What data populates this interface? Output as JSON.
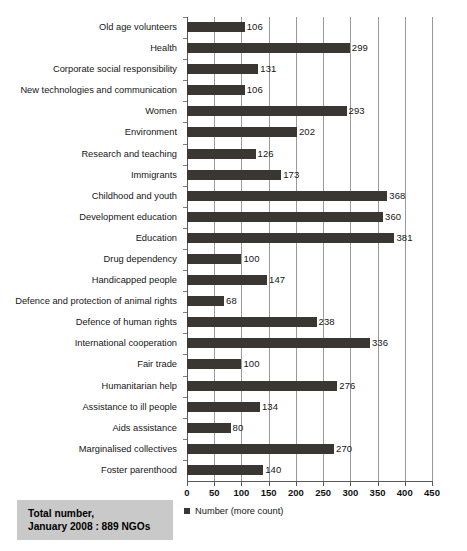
{
  "chart_data": {
    "type": "bar",
    "orientation": "horizontal",
    "title": "",
    "xlabel": "",
    "ylabel": "",
    "xlim": [
      0,
      450
    ],
    "xticks": [
      0,
      50,
      100,
      150,
      200,
      250,
      300,
      350,
      400,
      450
    ],
    "grid": true,
    "grid_axis": "x",
    "legend": {
      "position": "bottom-left",
      "entries": [
        {
          "label": "Number (more count)",
          "marker": "square",
          "color": "#3a3632"
        }
      ]
    },
    "bar_color": "#3a3632",
    "show_value_labels": true,
    "categories": [
      "Old age volunteers",
      "Health",
      "Corporate social responsibility",
      "New technologies and communication",
      "Women",
      "Environment",
      "Research and teaching",
      "Immigrants",
      "Childhood and youth",
      "Development education",
      "Education",
      "Drug dependency",
      "Handicapped people",
      "Defence and protection of animal rights",
      "Defence of human rights",
      "International cooperation",
      "Fair trade",
      "Humanitarian help",
      "Assistance to ill people",
      "Aids assistance",
      "Marginalised collectives",
      "Foster parenthood"
    ],
    "values": [
      106,
      299,
      131,
      106,
      293,
      202,
      126,
      173,
      368,
      360,
      381,
      100,
      147,
      68,
      238,
      336,
      100,
      276,
      134,
      80,
      270,
      140
    ],
    "series": [
      {
        "name": "Number (more count)",
        "values": [
          106,
          299,
          131,
          106,
          293,
          202,
          126,
          173,
          368,
          360,
          381,
          100,
          147,
          68,
          238,
          336,
          100,
          276,
          134,
          80,
          270,
          140
        ]
      }
    ]
  },
  "annotation": {
    "total_box": {
      "line1": "Total number,",
      "line2": "January 2008 : 889 NGOs",
      "background": "#c9c9c9"
    }
  }
}
